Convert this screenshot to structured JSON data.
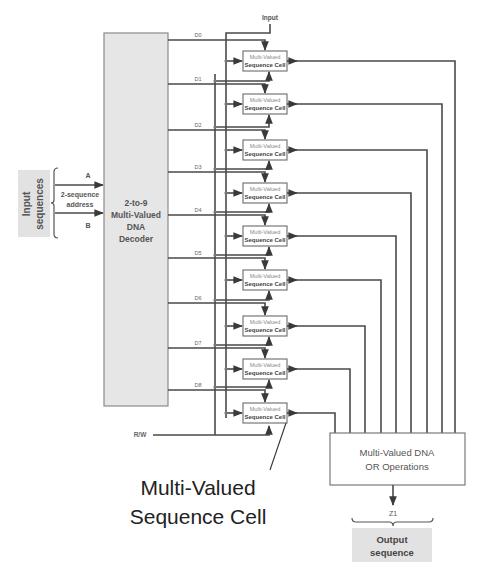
{
  "input_block": {
    "label_line1": "Input",
    "label_line2": "sequences",
    "address_label_line1": "2-sequence",
    "address_label_line2": "address",
    "signal_a": "A",
    "signal_b": "B"
  },
  "decoder": {
    "line1": "2-to-9",
    "line2": "Multi-Valued",
    "line3": "DNA",
    "line4": "Decoder"
  },
  "decoder_outputs": [
    "D0",
    "D1",
    "D2",
    "D3",
    "D4",
    "D5",
    "D6",
    "D7",
    "D8"
  ],
  "top_input_label": "Input",
  "rw_label": "R/W",
  "cells": [
    {
      "line1": "Multi-Valued",
      "line2": "Sequence Cell"
    },
    {
      "line1": "Multi-Valued",
      "line2": "Sequence Cell"
    },
    {
      "line1": "Multi-Valued",
      "line2": "Sequence Cell"
    },
    {
      "line1": "Multi-Valued",
      "line2": "Sequence Cell"
    },
    {
      "line1": "Multi-Valued",
      "line2": "Sequence Cell"
    },
    {
      "line1": "Multi-Valued",
      "line2": "Sequence Cell"
    },
    {
      "line1": "Multi-Valued",
      "line2": "Sequence Cell"
    },
    {
      "line1": "Multi-Valued",
      "line2": "Sequence Cell"
    },
    {
      "line1": "Multi-Valued",
      "line2": "Sequence Cell"
    }
  ],
  "or_block": {
    "line1": "Multi-Valued DNA",
    "line2": "OR Operations"
  },
  "output_signal": "Z1",
  "output_block": {
    "line1": "Output",
    "line2": "sequence"
  },
  "callout": {
    "line1": "Multi-Valued",
    "line2": "Sequence Cell"
  },
  "colors": {
    "shaded_box": "#e6e6e6",
    "wire": "#4a4a4a",
    "text_gray": "#555555"
  }
}
